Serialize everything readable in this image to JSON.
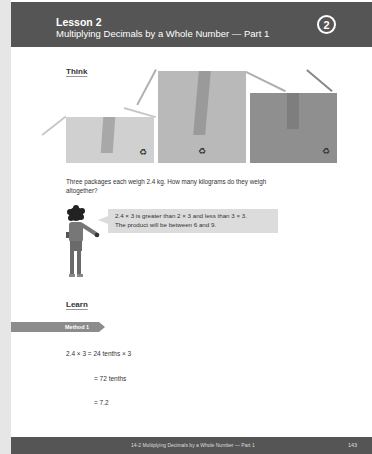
{
  "header": {
    "lesson_number": "Lesson 2",
    "lesson_title": "Multiplying Decimals by a Whole Number — Part 1",
    "unit_badge": "2"
  },
  "think": {
    "heading": "Think",
    "illustration": {
      "boxes": [
        {
          "name": "small-box",
          "color": "#d0d0d0",
          "tape_color": "#a8a8a8",
          "icon": "recycle-icon",
          "glyph": "♻"
        },
        {
          "name": "medium-box",
          "color": "#b9b9b9",
          "tape_color": "#9a9a9a",
          "icon": "recycle-icon",
          "glyph": "♻"
        },
        {
          "name": "large-box",
          "color": "#8f8f8f",
          "tape_color": "#7a7a7a",
          "icon": "recycle-icon",
          "glyph": "♻"
        }
      ]
    },
    "question_line1": "Three packages each weigh 2.4 kg. How many kilograms do they weigh",
    "question_line2": "altogether?",
    "speech_line1": "2.4 × 3 is greater than 2 × 3 and less than 3 × 3.",
    "speech_line2": "The product will be between 6 and 9."
  },
  "learn": {
    "heading": "Learn",
    "method_label": "Method 1",
    "steps": [
      "2.4 × 3 = 24 tenths × 3",
      "= 72 tenths",
      "= 7.2"
    ]
  },
  "footer": {
    "title": "14-2  Multiplying Decimals by a Whole Number — Part 1",
    "page_number": "143"
  }
}
